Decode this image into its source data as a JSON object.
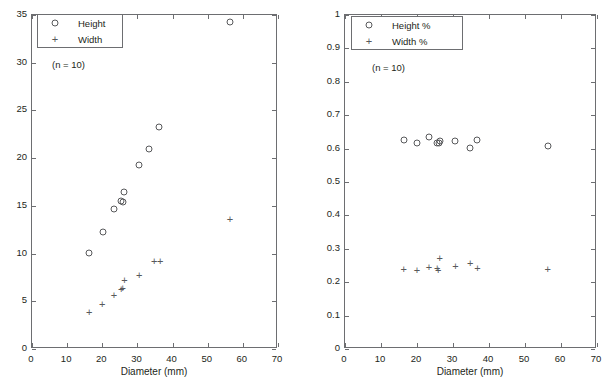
{
  "figure": {
    "background": "#ffffff",
    "marker_color": "#58595b",
    "axis_color": "#6d6e71"
  },
  "chart_data": [
    {
      "type": "scatter",
      "title": "",
      "xlabel": "Diameter (mm)",
      "ylabel": "",
      "xlim": [
        0,
        70
      ],
      "ylim": [
        0,
        35
      ],
      "xticks": [
        0,
        10,
        20,
        30,
        40,
        50,
        60,
        70
      ],
      "yticks": [
        0,
        5,
        10,
        15,
        20,
        25,
        30,
        35
      ],
      "xticklabels": [
        "0",
        "10",
        "20",
        "30",
        "40",
        "50",
        "60",
        "70"
      ],
      "yticklabels": [
        "0",
        "5",
        "10",
        "15",
        "20",
        "25",
        "30",
        "35"
      ],
      "grid": false,
      "legend_position": "upper-left",
      "annotation": "(n = 10)",
      "series": [
        {
          "name": "Height",
          "marker": "circle",
          "points": [
            {
              "x": 16.3,
              "y": 10.1
            },
            {
              "x": 20.2,
              "y": 12.3
            },
            {
              "x": 23.3,
              "y": 14.7
            },
            {
              "x": 25.4,
              "y": 15.5
            },
            {
              "x": 25.9,
              "y": 15.4
            },
            {
              "x": 26.3,
              "y": 16.4
            },
            {
              "x": 30.5,
              "y": 19.3
            },
            {
              "x": 33.3,
              "y": 21.0
            },
            {
              "x": 36.0,
              "y": 23.3
            },
            {
              "x": 56.3,
              "y": 34.3
            }
          ]
        },
        {
          "name": "Width",
          "marker": "plus",
          "points": [
            {
              "x": 16.3,
              "y": 3.9
            },
            {
              "x": 20.0,
              "y": 4.7
            },
            {
              "x": 23.3,
              "y": 5.7
            },
            {
              "x": 25.4,
              "y": 6.3
            },
            {
              "x": 25.8,
              "y": 6.4
            },
            {
              "x": 26.3,
              "y": 7.2
            },
            {
              "x": 30.5,
              "y": 7.8
            },
            {
              "x": 34.8,
              "y": 9.2
            },
            {
              "x": 36.5,
              "y": 9.2
            },
            {
              "x": 56.3,
              "y": 13.6
            }
          ]
        }
      ]
    },
    {
      "type": "scatter",
      "title": "",
      "xlabel": "Diameter (mm)",
      "ylabel": "",
      "xlim": [
        0,
        70
      ],
      "ylim": [
        0,
        1
      ],
      "xticks": [
        0,
        10,
        20,
        30,
        40,
        50,
        60,
        70
      ],
      "yticks": [
        0,
        0.1,
        0.2,
        0.3,
        0.4,
        0.5,
        0.6,
        0.7,
        0.8,
        0.9,
        1
      ],
      "xticklabels": [
        "0",
        "10",
        "20",
        "30",
        "40",
        "50",
        "60",
        "70"
      ],
      "yticklabels": [
        "0",
        "0.1",
        "0.2",
        "0.3",
        "0.4",
        "0.5",
        "0.6",
        "0.7",
        "0.8",
        "0.9",
        "1"
      ],
      "grid": false,
      "legend_position": "upper-left",
      "annotation": "(n = 10)",
      "series": [
        {
          "name": "Height %",
          "marker": "circle",
          "points": [
            {
              "x": 16.3,
              "y": 0.625
            },
            {
              "x": 20.0,
              "y": 0.618
            },
            {
              "x": 23.3,
              "y": 0.635
            },
            {
              "x": 25.6,
              "y": 0.618
            },
            {
              "x": 26.0,
              "y": 0.617
            },
            {
              "x": 26.4,
              "y": 0.622
            },
            {
              "x": 30.5,
              "y": 0.622
            },
            {
              "x": 34.8,
              "y": 0.602
            },
            {
              "x": 36.8,
              "y": 0.625
            },
            {
              "x": 56.3,
              "y": 0.608
            }
          ]
        },
        {
          "name": "Width %",
          "marker": "plus",
          "points": [
            {
              "x": 16.3,
              "y": 0.241
            },
            {
              "x": 20.0,
              "y": 0.236
            },
            {
              "x": 23.3,
              "y": 0.246
            },
            {
              "x": 25.6,
              "y": 0.243
            },
            {
              "x": 25.9,
              "y": 0.236
            },
            {
              "x": 26.3,
              "y": 0.271
            },
            {
              "x": 30.7,
              "y": 0.248
            },
            {
              "x": 34.8,
              "y": 0.256
            },
            {
              "x": 36.8,
              "y": 0.242
            },
            {
              "x": 56.3,
              "y": 0.24
            }
          ]
        }
      ]
    }
  ],
  "panels": [
    {
      "id": "left",
      "xlabel": "Diameter (mm)",
      "annotation": "(n = 10)",
      "legend": [
        {
          "label": "Height",
          "marker": "circle"
        },
        {
          "label": "Width",
          "marker": "plus"
        }
      ]
    },
    {
      "id": "right",
      "xlabel": "Diameter (mm)",
      "annotation": "(n = 10)",
      "legend": [
        {
          "label": "Height %",
          "marker": "circle"
        },
        {
          "label": "Width %",
          "marker": "plus"
        }
      ]
    }
  ]
}
